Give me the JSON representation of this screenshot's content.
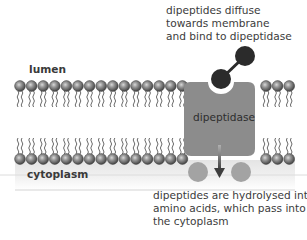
{
  "diagram": {
    "title": "",
    "regions": {
      "lumen_label": "lumen",
      "cytoplasm_label": "cytoplasm"
    },
    "enzyme": {
      "label": "dipeptidase",
      "color": "#8c8c8c"
    },
    "annotations": {
      "top": [
        "dipeptides diffuse",
        "towards membrane",
        "and bind to dipeptidase"
      ],
      "bottom": [
        "dipeptides are hydrolysed into",
        "amino acids, which pass into",
        "the cytoplasm"
      ]
    },
    "colors": {
      "dipeptide": "#2b2b2b",
      "amino_acid": "#a3a3a3",
      "phospholipid_head": "#7a7a7a",
      "cytoplasm_band": "#ececec",
      "arrow": "#4a4a4a"
    },
    "membrane": {
      "left_group_heads_per_row": 15,
      "right_group_heads_per_row": 3
    }
  }
}
